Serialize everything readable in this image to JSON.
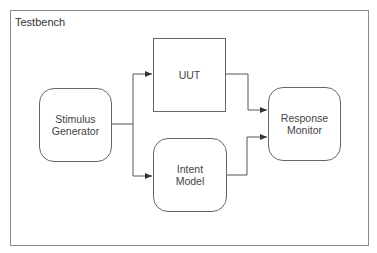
{
  "diagram": {
    "title": "Testbench",
    "blocks": [
      {
        "id": "stimulus",
        "label_lines": [
          "Stimulus",
          "Generator"
        ],
        "shape": "rounded"
      },
      {
        "id": "uut",
        "label_lines": [
          "UUT"
        ],
        "shape": "square"
      },
      {
        "id": "intent",
        "label_lines": [
          "Intent",
          "Model"
        ],
        "shape": "rounded"
      },
      {
        "id": "response",
        "label_lines": [
          "Response",
          "Monitor"
        ],
        "shape": "rounded"
      }
    ],
    "edges": [
      {
        "from": "Stimulus Generator",
        "to": "UUT"
      },
      {
        "from": "Stimulus Generator",
        "to": "Intent Model"
      },
      {
        "from": "UUT",
        "to": "Response Monitor"
      },
      {
        "from": "Intent Model",
        "to": "Response Monitor"
      }
    ],
    "colors": {
      "line": "#555555",
      "frame": "#8a8a8a",
      "text": "#444444"
    }
  }
}
